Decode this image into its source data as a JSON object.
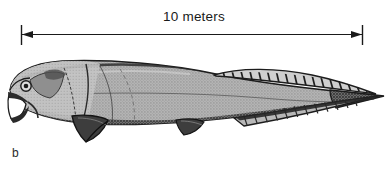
{
  "figure": {
    "label": "b",
    "background_color": "#ffffff",
    "ink_color": "#1a1a1a"
  },
  "scale": {
    "label": "10 meters",
    "value": 10,
    "unit": "meters",
    "left_tick_x": 21,
    "right_tick_x": 362,
    "line_y": 34,
    "left_arrow_name": "arrow-left",
    "right_arrow_name": "arrow-right"
  },
  "illustration": {
    "subject": "armored fish (placoderm) lateral view",
    "style": "halftone engraving",
    "body_fill": "#a9a9a9",
    "shadow_fill": "#4a4a4a",
    "outline_color": "#1c1c1c",
    "mouth_fill": "#ffffff",
    "parts": [
      {
        "name": "head-shield",
        "label": "head shield"
      },
      {
        "name": "eye",
        "label": "eye"
      },
      {
        "name": "jaw-upper",
        "label": "upper jaw plate"
      },
      {
        "name": "jaw-lower",
        "label": "lower jaw plate"
      },
      {
        "name": "gill-suture",
        "label": "gill suture line"
      },
      {
        "name": "pectoral-fin",
        "label": "pectoral fin"
      },
      {
        "name": "pelvic-fin",
        "label": "pelvic fin"
      },
      {
        "name": "dorsal-fin",
        "label": "dorsal fin"
      },
      {
        "name": "anal-fin",
        "label": "anal fin"
      },
      {
        "name": "tail",
        "label": "tail"
      }
    ]
  }
}
